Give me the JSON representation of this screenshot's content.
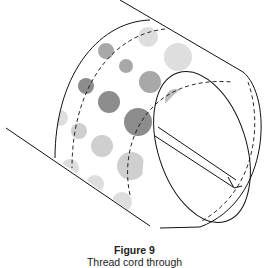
{
  "figure": {
    "label": "Figure 9",
    "caption": "Thread cord through",
    "colors": {
      "line": "#111111",
      "dot_dark": "#8c8c8c",
      "dot_mid": "#a8a8a8",
      "dot_light": "#cfcfcf",
      "dot_lighter": "#dedede"
    }
  }
}
